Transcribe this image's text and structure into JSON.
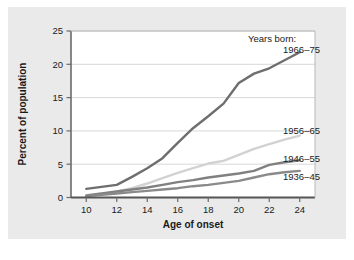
{
  "chart_data": {
    "type": "line",
    "title": "",
    "xlabel": "Age of onset",
    "ylabel": "Percent of population",
    "xlim": [
      9,
      25
    ],
    "ylim": [
      0,
      25
    ],
    "xticks": [
      "10",
      "12",
      "14",
      "16",
      "18",
      "20",
      "22",
      "24"
    ],
    "xtick_values": [
      10,
      12,
      14,
      16,
      18,
      20,
      22,
      24
    ],
    "yticks": [
      "0",
      "5",
      "10",
      "15",
      "20",
      "25"
    ],
    "ytick_values": [
      0,
      5,
      10,
      15,
      20,
      25
    ],
    "grid": "horizontal",
    "legend_position": "right-inline",
    "legend_heading": "Years born:",
    "x": [
      10,
      11,
      12,
      13,
      14,
      15,
      16,
      17,
      18,
      19,
      20,
      21,
      22,
      23,
      24
    ],
    "series": [
      {
        "name": "1966–75",
        "color": "#6e6e6e",
        "values": [
          1.3,
          1.6,
          1.9,
          3.1,
          4.4,
          5.9,
          8.2,
          10.4,
          12.2,
          14.1,
          17.2,
          18.6,
          19.4,
          20.6,
          21.8
        ]
      },
      {
        "name": "1956–65",
        "color": "#d2d2d2",
        "values": [
          0.2,
          0.5,
          0.9,
          1.4,
          2.1,
          2.9,
          3.7,
          4.4,
          5.1,
          5.5,
          6.4,
          7.3,
          8.0,
          8.7,
          9.3
        ]
      },
      {
        "name": "1946–55",
        "color": "#808080",
        "values": [
          0.3,
          0.6,
          0.9,
          1.2,
          1.5,
          1.9,
          2.3,
          2.6,
          3.0,
          3.3,
          3.6,
          4.0,
          4.9,
          5.3,
          5.6
        ]
      },
      {
        "name": "1936–45",
        "color": "#8a8a8a",
        "values": [
          0.2,
          0.4,
          0.6,
          0.8,
          1.0,
          1.2,
          1.4,
          1.7,
          1.9,
          2.2,
          2.5,
          3.0,
          3.5,
          3.8,
          4.0
        ]
      }
    ]
  },
  "colors": {
    "panel_background": "#eaeaea",
    "plot_background": "#ffffff",
    "grid": "#d8d8d8",
    "axis": "#6b6b6b",
    "text": "#1a1a1a"
  }
}
